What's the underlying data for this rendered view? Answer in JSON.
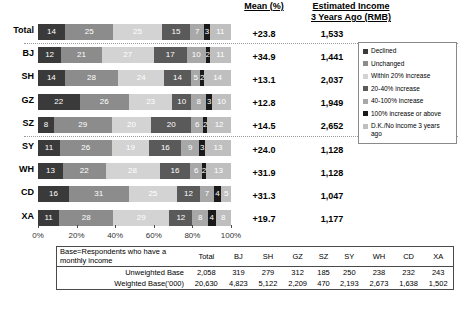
{
  "header": {
    "mean_label": "Mean (%)",
    "estimated_income_line1": "Estimated Income",
    "estimated_income_line2": "3 Years Ago (RMB)"
  },
  "legend": {
    "items": [
      {
        "label": "Declined",
        "color": "#3a3a3a"
      },
      {
        "label": "Unchanged",
        "color": "#8c8c8c"
      },
      {
        "label": "Within 20% increase",
        "color": "#d3d3d3"
      },
      {
        "label": "20-40% increase",
        "color": "#5a5a5a"
      },
      {
        "label": "40-100% increase",
        "color": "#a8a8a8"
      },
      {
        "label": "100% increase or above",
        "color": "#1a1a1a"
      },
      {
        "label": "D.K./No income 3 years ago",
        "color": "#bfbfbf"
      }
    ]
  },
  "xaxis": {
    "ticks": [
      "0%",
      "20%",
      "40%",
      "60%",
      "80%",
      "100%"
    ]
  },
  "chart_data": {
    "type": "bar",
    "subtype": "stacked-horizontal-100pct",
    "title": "",
    "xlabel": "",
    "ylabel": "",
    "xlim": [
      0,
      100
    ],
    "grid": false,
    "legend_position": "right",
    "categories": [
      "Total",
      "BJ",
      "SH",
      "GZ",
      "SZ",
      "SY",
      "WH",
      "CD",
      "XA"
    ],
    "series": [
      {
        "name": "Declined",
        "color": "#3a3a3a",
        "values": [
          14,
          12,
          14,
          22,
          8,
          11,
          13,
          16,
          11
        ]
      },
      {
        "name": "Unchanged",
        "color": "#8c8c8c",
        "values": [
          25,
          21,
          28,
          26,
          29,
          26,
          22,
          31,
          28
        ]
      },
      {
        "name": "Within 20% increase",
        "color": "#d3d3d3",
        "values": [
          25,
          27,
          24,
          23,
          20,
          19,
          28,
          25,
          29
        ]
      },
      {
        "name": "20-40% increase",
        "color": "#5a5a5a",
        "values": [
          15,
          17,
          14,
          10,
          20,
          16,
          16,
          12,
          12
        ]
      },
      {
        "name": "40-100% increase",
        "color": "#a8a8a8",
        "values": [
          7,
          10,
          5,
          8,
          6,
          9,
          6,
          7,
          8
        ]
      },
      {
        "name": "100% increase or above",
        "color": "#1a1a1a",
        "values": [
          3,
          2,
          2,
          3,
          2,
          3,
          2,
          4,
          4
        ]
      },
      {
        "name": "D.K./No income 3 years ago",
        "color": "#bfbfbf",
        "values": [
          11,
          11,
          14,
          10,
          12,
          13,
          13,
          5,
          8
        ]
      }
    ],
    "mean_pct": [
      "+23.8",
      "+34.9",
      "+13.1",
      "+12.8",
      "+14.5",
      "+24.0",
      "+31.9",
      "+31.3",
      "+19.7"
    ],
    "estimated_income": [
      "1,533",
      "1,441",
      "2,037",
      "1,949",
      "2,652",
      "1,128",
      "1,128",
      "1,047",
      "1,177"
    ]
  },
  "base_table": {
    "lead_header_line1": "Base=Respondents who have a",
    "lead_header_line2": "monthly income",
    "columns": [
      "Total",
      "BJ",
      "SH",
      "GZ",
      "SZ",
      "SY",
      "WH",
      "CD",
      "XA"
    ],
    "rows": [
      {
        "label": "Unweighted Base",
        "values": [
          "2,058",
          "319",
          "279",
          "312",
          "185",
          "250",
          "238",
          "232",
          "243"
        ]
      },
      {
        "label": "Weighted Base('000)",
        "values": [
          "20,630",
          "4,823",
          "5,122",
          "2,209",
          "470",
          "2,193",
          "2,673",
          "1,638",
          "1,502"
        ]
      }
    ]
  }
}
